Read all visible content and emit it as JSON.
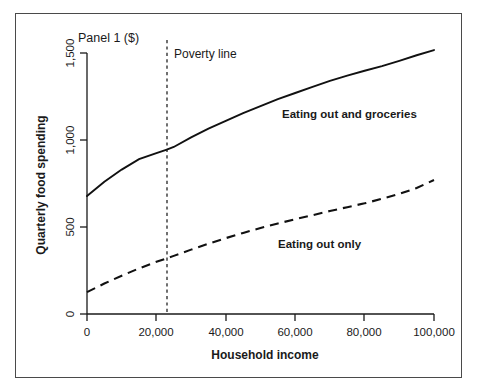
{
  "chart_data": {
    "type": "line",
    "title": "Panel 1 ($)",
    "xlabel": "Household income",
    "ylabel": "Quarterly food spending",
    "xlim": [
      0,
      100000
    ],
    "ylim": [
      0,
      1500
    ],
    "grid": false,
    "legend_position": "inline-labels",
    "x_ticks": [
      0,
      20000,
      40000,
      60000,
      80000,
      100000
    ],
    "x_tick_labels": [
      "0",
      "20,000",
      "40,000",
      "60,000",
      "80,000",
      "100,000"
    ],
    "y_ticks": [
      0,
      500,
      1000,
      1500
    ],
    "y_tick_labels": [
      "0",
      "500",
      "1,000",
      "1,500"
    ],
    "x": [
      0,
      5000,
      10000,
      15000,
      20000,
      23000,
      25000,
      30000,
      35000,
      40000,
      45000,
      50000,
      55000,
      60000,
      65000,
      70000,
      75000,
      80000,
      85000,
      90000,
      95000,
      100000
    ],
    "series": [
      {
        "name": "Eating out and groceries",
        "style": "solid",
        "values": [
          678,
          760,
          830,
          890,
          925,
          945,
          960,
          1015,
          1065,
          1110,
          1155,
          1195,
          1235,
          1270,
          1305,
          1340,
          1370,
          1398,
          1425,
          1455,
          1487,
          1517
        ]
      },
      {
        "name": "Eating out only",
        "style": "dashed",
        "values": [
          126,
          175,
          220,
          262,
          300,
          320,
          334,
          370,
          404,
          436,
          466,
          494,
          520,
          545,
          568,
          592,
          614,
          636,
          662,
          690,
          724,
          770
        ]
      }
    ],
    "annotations": [
      {
        "name": "poverty-line",
        "label": "Poverty line",
        "type": "vertical-line",
        "x": 23000
      }
    ]
  }
}
